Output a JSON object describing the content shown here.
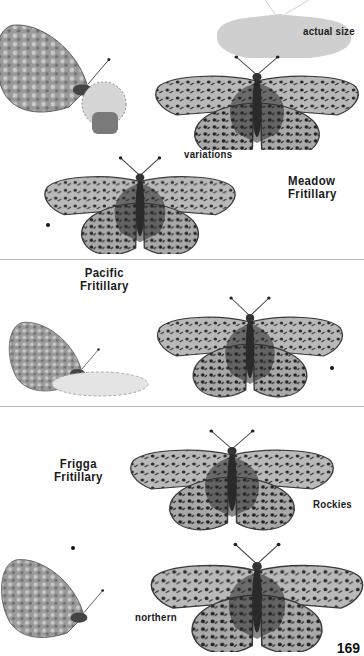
{
  "page": {
    "number": "169",
    "palette": {
      "background": "#ffffff",
      "divider": "#b8b8b8",
      "text": "#1a1a1a",
      "wing_light": "#bdbdbd",
      "wing_dark": "#2a2a2a",
      "silhouette": "#cfcfcf"
    }
  },
  "sections": [
    {
      "species": [
        "Meadow",
        "Fritillary"
      ],
      "labels": {
        "actual_size": "actual size",
        "variations": "variations"
      },
      "figures": [
        "underside-on-flower",
        "actual-size-silhouette",
        "upperside-large",
        "upperside-variation"
      ]
    },
    {
      "species": [
        "Pacific",
        "Fritillary"
      ],
      "labels": {},
      "figures": [
        "underside-on-flower",
        "upperside"
      ]
    },
    {
      "species": [
        "Frigga",
        "Fritillary"
      ],
      "labels": {
        "rockies": "Rockies",
        "northern": "northern"
      },
      "figures": [
        "upperside-rockies",
        "underside",
        "upperside-northern"
      ]
    }
  ]
}
